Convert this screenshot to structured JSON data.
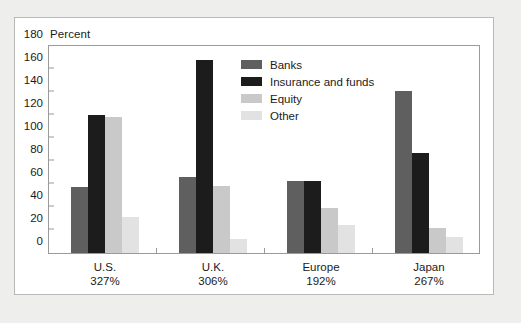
{
  "chart_data": {
    "type": "bar",
    "title": "",
    "subtitle": "",
    "xlabel": "",
    "ylabel": "Percent",
    "ylim": [
      0,
      180
    ],
    "yticks": [
      0,
      20,
      40,
      60,
      80,
      100,
      120,
      140,
      160,
      180
    ],
    "grid": false,
    "legend_position": "upper right inside plot",
    "categories": [
      "U.S.",
      "U.K.",
      "Europe",
      "Japan"
    ],
    "category_sublabels": [
      "327%",
      "306%",
      "192%",
      "267%"
    ],
    "series": [
      {
        "name": "Banks",
        "color": "#5f5f5f",
        "values": [
          57,
          66,
          63,
          141
        ]
      },
      {
        "name": "Insurance and funds",
        "color": "#1c1c1c",
        "values": [
          120,
          168,
          63,
          87
        ]
      },
      {
        "name": "Equity",
        "color": "#c9c9c9",
        "values": [
          118,
          58,
          39,
          22
        ]
      },
      {
        "name": "Other",
        "color": "#e2e2e2",
        "values": [
          31,
          12,
          24,
          14
        ]
      }
    ]
  },
  "axis": {
    "title": "Percent",
    "tick_labels": [
      "180",
      "160",
      "140",
      "120",
      "100",
      "80",
      "60",
      "40",
      "20",
      "0"
    ]
  },
  "legend": {
    "items": [
      {
        "label": "Banks"
      },
      {
        "label": "Insurance and funds"
      },
      {
        "label": "Equity"
      },
      {
        "label": "Other"
      }
    ]
  },
  "xaxis": {
    "groups": [
      {
        "name": "U.S.",
        "total": "327%"
      },
      {
        "name": "U.K.",
        "total": "306%"
      },
      {
        "name": "Europe",
        "total": "192%"
      },
      {
        "name": "Japan",
        "total": "267%"
      }
    ]
  },
  "colors": {
    "page_background": "#eeeeec",
    "panel_background": "#ffffff",
    "panel_border": "#b9b9b9",
    "axis_line": "#9a9a9a",
    "text": "#1b1b1b"
  }
}
